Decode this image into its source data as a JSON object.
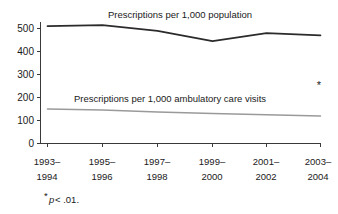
{
  "chart_data": {
    "type": "line",
    "title": "",
    "subtitle": "",
    "xlabel": "",
    "ylabel": "",
    "ylim": [
      0,
      560
    ],
    "yticks": [
      0,
      100,
      200,
      300,
      400,
      500
    ],
    "ytick_labels": [
      "0",
      "100",
      "200",
      "300",
      "400",
      "500"
    ],
    "grid": false,
    "legend_position": "inline-labels",
    "categories": [
      "1993–1994",
      "1995–1996",
      "1997–1998",
      "1999–2000",
      "2001–2002",
      "2003–2004"
    ],
    "category_lines": [
      [
        "1993–",
        "1994"
      ],
      [
        "1995–",
        "1996"
      ],
      [
        "1997–",
        "1998"
      ],
      [
        "1999–",
        "2000"
      ],
      [
        "2001–",
        "2002"
      ],
      [
        "2003–",
        "2004"
      ]
    ],
    "series": [
      {
        "name": "Prescriptions per 1,000 population",
        "values": [
          510,
          515,
          490,
          445,
          480,
          470
        ],
        "color": "#2b2b2b",
        "label_text": "Prescriptions per 1,000 population"
      },
      {
        "name": "Prescriptions per 1,000 ambulatory care visits",
        "values": [
          150,
          146,
          137,
          130,
          125,
          120
        ],
        "color": "#9a9a9a",
        "label_text": "Prescriptions per 1,000 ambulatory care visits"
      }
    ],
    "annotations": [
      {
        "name": "significance-marker",
        "text": "*"
      }
    ]
  },
  "footnote": {
    "star": "*",
    "statistic": "p",
    "comparison": " < .01."
  },
  "colors": {
    "axis": "#3a3a3a",
    "text": "#1a1a1a",
    "series_primary": "#2b2b2b",
    "series_secondary": "#9a9a9a",
    "background": "#ffffff"
  }
}
